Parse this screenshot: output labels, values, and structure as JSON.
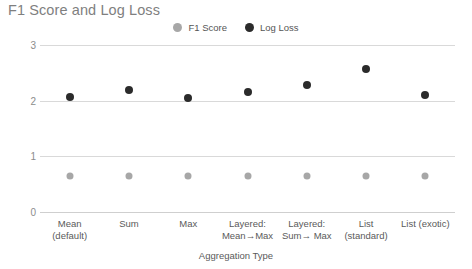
{
  "chart_data": {
    "type": "scatter",
    "title": "F1 Score and Log Loss",
    "xlabel": "Aggregation Type",
    "ylabel": "",
    "ylim": [
      0,
      3
    ],
    "yticks": [
      0,
      1,
      2,
      3
    ],
    "grid": true,
    "legend_position": "top-center",
    "categories": [
      "Mean\n(default)",
      "Sum",
      "Max",
      "Layered:\nMean→Max",
      "Layered:\nSum→ Max",
      "List\n(standard)",
      "List (exotic)"
    ],
    "series": [
      {
        "name": "F1 Score",
        "color": "#a7a7a7",
        "values": [
          0.64,
          0.64,
          0.64,
          0.64,
          0.64,
          0.64,
          0.64
        ]
      },
      {
        "name": "Log Loss",
        "color": "#2b2b2b",
        "values": [
          2.06,
          2.2,
          2.04,
          2.16,
          2.29,
          2.56,
          2.1
        ]
      }
    ]
  },
  "legend": {
    "items": [
      {
        "label": "F1 Score",
        "color": "#a7a7a7"
      },
      {
        "label": "Log Loss",
        "color": "#2b2b2b"
      }
    ]
  },
  "xtick_labels": [
    {
      "line1": "Mean",
      "line2": "(default)"
    },
    {
      "line1": "Sum",
      "line2": ""
    },
    {
      "line1": "Max",
      "line2": ""
    },
    {
      "line1": "Layered:",
      "line2": "Mean→Max"
    },
    {
      "line1": "Layered:",
      "line2": "Sum→ Max"
    },
    {
      "line1": "List",
      "line2": "(standard)"
    },
    {
      "line1": "List (exotic)",
      "line2": ""
    }
  ],
  "ytick_labels": [
    "3",
    "2",
    "1",
    "0"
  ]
}
